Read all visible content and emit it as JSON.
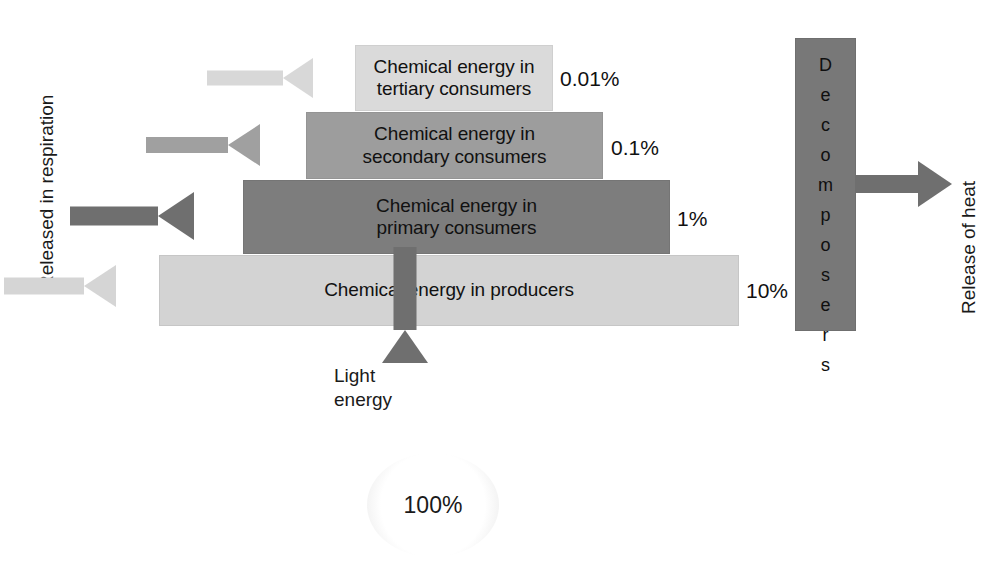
{
  "diagram": {
    "tiers": [
      {
        "id": "tertiary",
        "label": "Chemical energy in\ntertiary consumers",
        "percent": "0.01%",
        "color": "#dadada"
      },
      {
        "id": "secondary",
        "label": "Chemical energy in\nsecondary consumers",
        "percent": "0.1%",
        "color": "#9d9d9d"
      },
      {
        "id": "primary",
        "label": "Chemical energy in\nprimary consumers",
        "percent": "1%",
        "color": "#7d7d7d"
      },
      {
        "id": "producers",
        "label": "Chemical energy in producers",
        "percent": "10%",
        "color": "#d3d3d3"
      }
    ],
    "respiration": {
      "caption": "Released in respiration",
      "arrow_direction": "left"
    },
    "decomposers": {
      "label": "Decomposers",
      "letters": [
        "D",
        "e",
        "c",
        "o",
        "m",
        "p",
        "o",
        "s",
        "e",
        "r",
        "s"
      ],
      "color": "#787878"
    },
    "heat": {
      "caption": "Release of heat",
      "arrow_direction": "right",
      "color": "#6f6f6f"
    },
    "light": {
      "label": "Light\nenergy",
      "arrow_direction": "up",
      "color": "#6f6f6f"
    },
    "sun": {
      "value": "100%"
    }
  },
  "chart_data": {
    "type": "bar",
    "categories": [
      "Chemical energy in producers",
      "Chemical energy in primary consumers",
      "Chemical energy in secondary consumers",
      "Chemical energy in tertiary consumers"
    ],
    "values": [
      10,
      1,
      0.1,
      0.01
    ],
    "value_labels": [
      "10%",
      "1%",
      "0.1%",
      "0.01%"
    ],
    "input": {
      "label": "Light energy",
      "value": 100,
      "value_label": "100%"
    },
    "losses": [
      "Released in respiration",
      "Release of heat"
    ],
    "other_nodes": [
      "Decomposers"
    ],
    "xlabel": "",
    "ylabel": "Percentage of incident light energy",
    "grid": false,
    "legend": "none"
  }
}
